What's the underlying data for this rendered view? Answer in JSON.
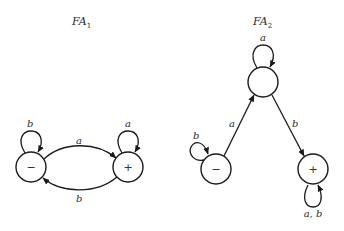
{
  "colors": {
    "background": "#ffffff",
    "stroke": "#1a1a1a",
    "text": "#2a2a2a"
  },
  "automata": [
    {
      "id": "FA1",
      "title": {
        "main": "FA",
        "subscript": "1"
      },
      "states": [
        {
          "id": "s1",
          "marker": "−",
          "start": true,
          "final": false
        },
        {
          "id": "s2",
          "marker": "+",
          "start": false,
          "final": true
        }
      ],
      "transitions": [
        {
          "from": "s1",
          "to": "s1",
          "label": "b"
        },
        {
          "from": "s1",
          "to": "s2",
          "label": "a"
        },
        {
          "from": "s2",
          "to": "s2",
          "label": "a"
        },
        {
          "from": "s2",
          "to": "s1",
          "label": "b"
        }
      ]
    },
    {
      "id": "FA2",
      "title": {
        "main": "FA",
        "subscript": "2"
      },
      "states": [
        {
          "id": "t1",
          "marker": "−",
          "start": true,
          "final": false
        },
        {
          "id": "t2",
          "marker": "",
          "start": false,
          "final": false
        },
        {
          "id": "t3",
          "marker": "+",
          "start": false,
          "final": true
        }
      ],
      "transitions": [
        {
          "from": "t1",
          "to": "t1",
          "label": "b"
        },
        {
          "from": "t1",
          "to": "t2",
          "label": "a"
        },
        {
          "from": "t2",
          "to": "t2",
          "label": "a"
        },
        {
          "from": "t2",
          "to": "t3",
          "label": "b"
        },
        {
          "from": "t3",
          "to": "t3",
          "label": "a, b"
        }
      ]
    }
  ]
}
